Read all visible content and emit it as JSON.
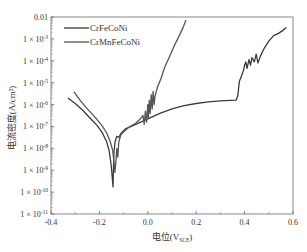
{
  "chart_data": {
    "type": "line",
    "title": "",
    "xlabel": "电位(V_SCE)",
    "xlabel_main": "电位(V",
    "xlabel_sub": "SCE",
    "xlabel_close": ")",
    "ylabel": "电流密度(A/cm²)",
    "xlim": [
      -0.4,
      0.6
    ],
    "ylim_log10": [
      -11,
      -2
    ],
    "yscale": "log",
    "grid": false,
    "legend_position": "upper left",
    "x_ticks": [
      "-0.4",
      "-0.2",
      "0.0",
      "0.2",
      "0.4",
      "0.6"
    ],
    "x_tick_values": [
      -0.4,
      -0.2,
      0.0,
      0.2,
      0.4,
      0.6
    ],
    "y_ticks": [
      {
        "mant": "0.01",
        "exp": ""
      },
      {
        "mant": "1 × 10",
        "exp": "-3"
      },
      {
        "mant": "1 × 10",
        "exp": "-4"
      },
      {
        "mant": "1 × 10",
        "exp": "-5"
      },
      {
        "mant": "1 × 10",
        "exp": "-6"
      },
      {
        "mant": "1 × 10",
        "exp": "-7"
      },
      {
        "mant": "1 × 10",
        "exp": "-8"
      },
      {
        "mant": "1 × 10",
        "exp": "-9"
      },
      {
        "mant": "1 × 10",
        "exp": "-10"
      },
      {
        "mant": "1 × 10",
        "exp": "-11"
      }
    ],
    "y_tick_log10": [
      -2,
      -3,
      -4,
      -5,
      -6,
      -7,
      -8,
      -9,
      -10,
      -11
    ],
    "series": [
      {
        "name": "CrFeCoNi",
        "color": "#3a3a3a",
        "points_log10": [
          [
            -0.33,
            -5.7
          ],
          [
            -0.3,
            -5.95
          ],
          [
            -0.27,
            -6.25
          ],
          [
            -0.24,
            -6.6
          ],
          [
            -0.21,
            -6.95
          ],
          [
            -0.19,
            -7.25
          ],
          [
            -0.17,
            -7.7
          ],
          [
            -0.16,
            -8.1
          ],
          [
            -0.152,
            -8.7
          ],
          [
            -0.147,
            -9.3
          ],
          [
            -0.144,
            -9.76
          ],
          [
            -0.142,
            -9.0
          ],
          [
            -0.14,
            -8.2
          ],
          [
            -0.135,
            -7.7
          ],
          [
            -0.128,
            -7.45
          ],
          [
            -0.12,
            -7.5
          ],
          [
            -0.11,
            -7.3
          ],
          [
            -0.09,
            -7.1
          ],
          [
            -0.05,
            -6.9
          ],
          [
            0.0,
            -6.65
          ],
          [
            0.05,
            -6.4
          ],
          [
            0.1,
            -6.2
          ],
          [
            0.15,
            -6.05
          ],
          [
            0.2,
            -5.95
          ],
          [
            0.25,
            -5.88
          ],
          [
            0.3,
            -5.83
          ],
          [
            0.365,
            -5.8
          ],
          [
            0.372,
            -5.6
          ],
          [
            0.378,
            -4.95
          ],
          [
            0.385,
            -4.75
          ],
          [
            0.395,
            -4.45
          ],
          [
            0.4,
            -4.2
          ],
          [
            0.405,
            -4.05
          ],
          [
            0.41,
            -4.35
          ],
          [
            0.418,
            -3.95
          ],
          [
            0.425,
            -4.2
          ],
          [
            0.43,
            -3.85
          ],
          [
            0.44,
            -4.05
          ],
          [
            0.448,
            -3.7
          ],
          [
            0.455,
            -4.1
          ],
          [
            0.465,
            -3.8
          ],
          [
            0.48,
            -3.45
          ],
          [
            0.5,
            -3.1
          ],
          [
            0.52,
            -2.85
          ],
          [
            0.54,
            -2.75
          ],
          [
            0.56,
            -2.6
          ],
          [
            0.572,
            -2.48
          ]
        ]
      },
      {
        "name": "CrMnFeCoNi",
        "color": "#555555",
        "points_log10": [
          [
            -0.305,
            -5.42
          ],
          [
            -0.28,
            -5.8
          ],
          [
            -0.25,
            -6.2
          ],
          [
            -0.22,
            -6.55
          ],
          [
            -0.19,
            -6.95
          ],
          [
            -0.17,
            -7.3
          ],
          [
            -0.155,
            -7.7
          ],
          [
            -0.145,
            -8.1
          ],
          [
            -0.14,
            -8.6
          ],
          [
            -0.136,
            -9.1
          ],
          [
            -0.132,
            -8.6
          ],
          [
            -0.128,
            -8.0
          ],
          [
            -0.124,
            -8.4
          ],
          [
            -0.12,
            -7.7
          ],
          [
            -0.112,
            -7.4
          ],
          [
            -0.1,
            -7.25
          ],
          [
            -0.08,
            -7.05
          ],
          [
            -0.05,
            -6.85
          ],
          [
            -0.03,
            -6.65
          ],
          [
            -0.02,
            -6.5
          ],
          [
            -0.015,
            -6.9
          ],
          [
            -0.01,
            -6.3
          ],
          [
            -0.005,
            -6.8
          ],
          [
            0.0,
            -6.0
          ],
          [
            0.003,
            -6.6
          ],
          [
            0.006,
            -5.8
          ],
          [
            0.01,
            -6.4
          ],
          [
            0.014,
            -5.55
          ],
          [
            0.018,
            -6.2
          ],
          [
            0.022,
            -5.4
          ],
          [
            0.026,
            -6.0
          ],
          [
            0.03,
            -5.6
          ],
          [
            0.04,
            -5.2
          ],
          [
            0.055,
            -4.8
          ],
          [
            0.07,
            -4.3
          ],
          [
            0.09,
            -3.8
          ],
          [
            0.11,
            -3.3
          ],
          [
            0.13,
            -2.85
          ],
          [
            0.145,
            -2.5
          ],
          [
            0.158,
            -2.14
          ]
        ]
      }
    ],
    "plot_area_px": {
      "left": 51,
      "top": 17,
      "right": 293,
      "bottom": 214
    }
  }
}
